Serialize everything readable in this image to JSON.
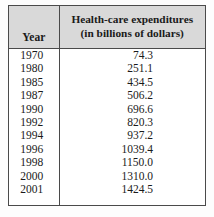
{
  "table": {
    "headers": {
      "year": "Year",
      "expenditures_line1": "Health-care expenditures",
      "expenditures_line2": "(in billions of dollars)"
    },
    "rows": [
      {
        "year": "1970",
        "value": "74.3"
      },
      {
        "year": "1980",
        "value": "251.1"
      },
      {
        "year": "1985",
        "value": "434.5"
      },
      {
        "year": "1987",
        "value": "506.2"
      },
      {
        "year": "1990",
        "value": "696.6"
      },
      {
        "year": "1992",
        "value": "820.3"
      },
      {
        "year": "1994",
        "value": "937.2"
      },
      {
        "year": "1996",
        "value": "1039.4"
      },
      {
        "year": "1998",
        "value": "1150.0"
      },
      {
        "year": "2000",
        "value": "1310.0"
      },
      {
        "year": "2001",
        "value": "1424.5"
      }
    ]
  },
  "chart_data": {
    "type": "table",
    "title": "Health-care expenditures (in billions of dollars)",
    "xlabel": "Year",
    "ylabel": "Health-care expenditures (in billions of dollars)",
    "categories": [
      "1970",
      "1980",
      "1985",
      "1987",
      "1990",
      "1992",
      "1994",
      "1996",
      "1998",
      "2000",
      "2001"
    ],
    "values": [
      74.3,
      251.1,
      434.5,
      506.2,
      696.6,
      820.3,
      937.2,
      1039.4,
      1150.0,
      1310.0,
      1424.5
    ],
    "columns": [
      "Year",
      "Health-care expenditures (in billions of dollars)"
    ]
  },
  "style": {
    "border_color": "#4a4a4a",
    "header_background": "#d9d9d9",
    "body_background": "#ffffff",
    "page_background": "#fdfdfd",
    "text_color": "#1a1a1a"
  }
}
